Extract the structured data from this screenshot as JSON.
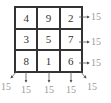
{
  "grid": {
    "rows": [
      [
        "4",
        "9",
        "2"
      ],
      [
        "3",
        "5",
        "7"
      ],
      [
        "8",
        "1",
        "6"
      ]
    ]
  },
  "sums": {
    "rows": [
      "15",
      "15",
      "15"
    ],
    "columns": [
      "15",
      "15",
      "15"
    ],
    "diagonal_left": "15",
    "diagonal_right": "15"
  },
  "colors": {
    "grid_line": "#333333",
    "sum_text": "#9a9a9a",
    "arrow": "#555555"
  }
}
